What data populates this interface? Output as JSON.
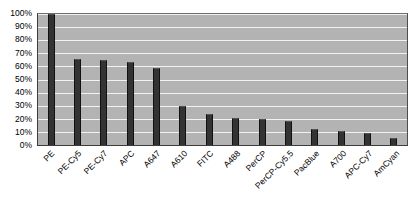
{
  "chart_data": {
    "type": "bar",
    "title": "",
    "subtitle": "",
    "xlabel": "",
    "ylabel": "",
    "ylim": [
      0,
      100
    ],
    "y_tick_labels": [
      "100%",
      "90%",
      "80%",
      "70%",
      "60%",
      "50%",
      "40%",
      "30%",
      "20%",
      "10%",
      "0%"
    ],
    "y_tick_values": [
      100,
      90,
      80,
      70,
      60,
      50,
      40,
      30,
      20,
      10,
      0
    ],
    "grid": true,
    "legend": "none",
    "categories": [
      "PE",
      "PE-Cy5",
      "PE-Cy7",
      "APC",
      "A647",
      "A610",
      "FITC",
      "A488",
      "PerCP",
      "PerCP-Cy5.5",
      "PacBlue",
      "A700",
      "APC-Cy7",
      "AmCyan"
    ],
    "values": [
      100,
      66,
      65,
      63,
      59,
      30,
      24,
      21,
      20,
      18,
      12,
      10.5,
      9.5,
      5.5
    ],
    "colors": {
      "bar": "#333333",
      "plot_background": "#b3b3b3",
      "gridline": "#f2f2f2",
      "axis_text": "#000000",
      "page_background": "#ffffff"
    }
  }
}
